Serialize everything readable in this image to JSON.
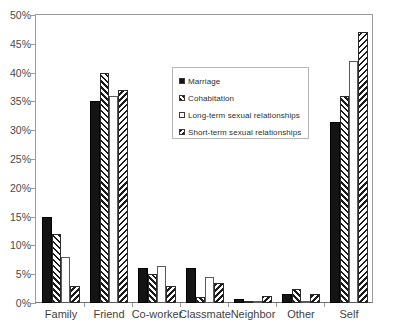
{
  "chart_data": {
    "type": "bar",
    "title": "",
    "xlabel": "",
    "ylabel": "",
    "ylim": [
      0,
      50
    ],
    "ytick_step": 5,
    "grid": false,
    "legend_position": "inside-upper-center",
    "categories": [
      "Family",
      "Friend",
      "Co-worker",
      "Classmate",
      "Neighbor",
      "Other",
      "Self"
    ],
    "ytick_labels": [
      "0%",
      "5%",
      "10%",
      "15%",
      "20%",
      "25%",
      "30%",
      "35%",
      "40%",
      "45%",
      "50%"
    ],
    "series": [
      {
        "name": "Marriage",
        "pattern": "solid-black-dotted",
        "values": [
          15.0,
          35.0,
          6.0,
          6.0,
          0.7,
          1.5,
          31.5
        ]
      },
      {
        "name": "Cohabitation",
        "pattern": "diagonal-hatch-forward",
        "values": [
          12.0,
          40.0,
          5.0,
          1.0,
          0.3,
          2.5,
          36.0
        ]
      },
      {
        "name": "Long-term sexual relationships",
        "pattern": "white-empty",
        "values": [
          8.0,
          36.0,
          6.5,
          4.5,
          0.2,
          0.3,
          42.0
        ]
      },
      {
        "name": "Short-term sexual relationships",
        "pattern": "diagonal-hatch-backward",
        "values": [
          3.0,
          37.0,
          3.0,
          3.5,
          1.2,
          1.5,
          47.0
        ]
      }
    ]
  },
  "title_sliver": "",
  "colors": {
    "axis": "#9b9b9b",
    "baseline": "#6f6f6f",
    "series_dark": "#141414",
    "hatch": "#1b1b1b",
    "legend_border": "#b6b6b6",
    "text": "#3a3a3a"
  }
}
